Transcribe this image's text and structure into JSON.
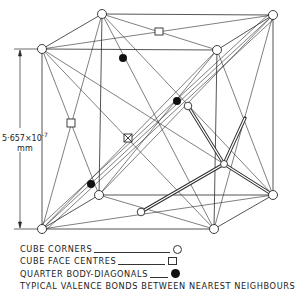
{
  "diagram": {
    "dimension": {
      "value": "5·657×10",
      "exponent": "-7",
      "unit": "mm"
    },
    "colors": {
      "line": "#2a2a2a",
      "background": "#ffffff",
      "filled_atom": "#111111"
    },
    "cube_corners": [
      [
        102,
        14
      ],
      [
        273,
        15
      ],
      [
        273,
        195
      ],
      [
        99,
        195
      ],
      [
        42,
        49
      ],
      [
        217,
        50
      ],
      [
        214,
        229
      ],
      [
        42,
        229
      ]
    ],
    "face_centres_square": [
      [
        159,
        32
      ],
      [
        71,
        123
      ],
      [
        128,
        138
      ]
    ],
    "face_centres_circle": [
      [
        188,
        106
      ],
      [
        141,
        212
      ],
      [
        224,
        164
      ]
    ],
    "quarter_body_diagonals": [
      [
        123,
        58
      ],
      [
        177,
        101
      ],
      [
        91,
        184
      ]
    ]
  },
  "legend": {
    "items": [
      {
        "label": "CUBE CORNERS",
        "symbol": "open-circle",
        "leader_width": 76
      },
      {
        "label": "CUBE FACE CENTRES",
        "symbol": "open-square",
        "leader_width": 47
      },
      {
        "label": "QUARTER BODY-DIAGONALS",
        "symbol": "filled-circle",
        "leader_width": 18
      },
      {
        "label": "TYPICAL VALENCE BONDS BETWEEN NEAREST NEIGHBOURS",
        "symbol": "double-line",
        "leader_width": 0
      }
    ]
  }
}
